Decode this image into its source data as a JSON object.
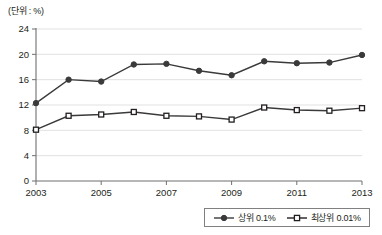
{
  "unit_label": "(단위 : %)",
  "legend": {
    "items": [
      {
        "label": "상위 0.1%",
        "marker": "filled-circle-icon",
        "color": "#3a3a3a"
      },
      {
        "label": "최상위 0.01%",
        "marker": "open-square-icon",
        "color": "#231f20"
      }
    ]
  },
  "chart_data": {
    "type": "line",
    "title": "",
    "subtitle": "",
    "xlabel": "",
    "ylabel": "",
    "unit": "%",
    "grid": true,
    "legend_position": "bottom-right",
    "x": [
      2003,
      2004,
      2005,
      2006,
      2007,
      2008,
      2009,
      2010,
      2011,
      2012,
      2013
    ],
    "xlim": [
      2003,
      2013
    ],
    "xticks": [
      2003,
      2005,
      2007,
      2009,
      2011,
      2013
    ],
    "xtick_labels": [
      "2003",
      "2005",
      "2007",
      "2009",
      "2011",
      "2013"
    ],
    "ylim": [
      0,
      24
    ],
    "yticks": [
      0,
      4,
      8,
      12,
      16,
      20,
      24
    ],
    "ytick_labels": [
      "0",
      "4",
      "8",
      "12",
      "16",
      "20",
      "24"
    ],
    "series": [
      {
        "name": "상위 0.1%",
        "marker": "filled-circle",
        "color": "#3a3a3a",
        "values": [
          12.3,
          16.0,
          15.7,
          18.4,
          18.5,
          17.4,
          16.7,
          18.9,
          18.6,
          18.7,
          19.9
        ]
      },
      {
        "name": "최상위 0.01%",
        "marker": "open-square",
        "color": "#231f20",
        "values": [
          8.1,
          10.3,
          10.5,
          10.9,
          10.3,
          10.2,
          9.7,
          11.6,
          11.2,
          11.1,
          11.5
        ]
      }
    ]
  }
}
